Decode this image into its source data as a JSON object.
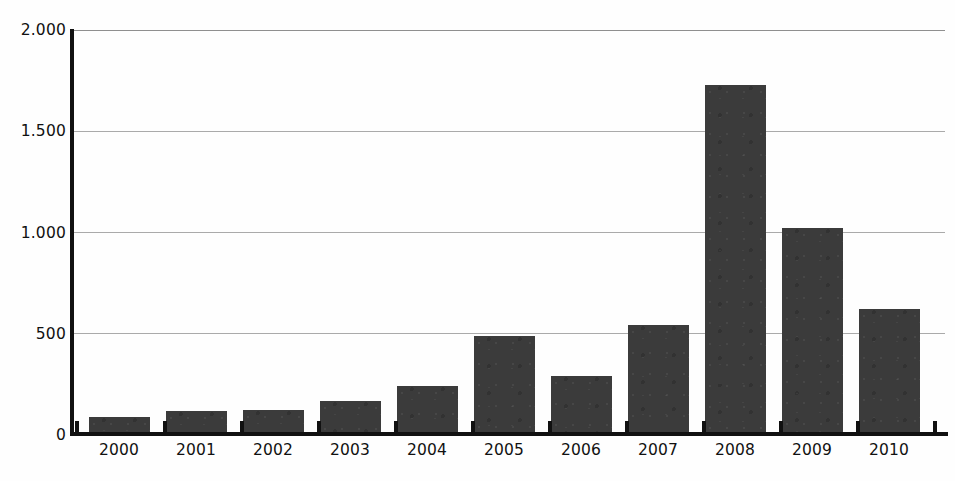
{
  "chart_data": {
    "type": "bar",
    "title": "",
    "subtitle": "",
    "xlabel": "",
    "ylabel": "",
    "categories": [
      "2000",
      "2001",
      "2002",
      "2003",
      "2004",
      "2005",
      "2006",
      "2007",
      "2008",
      "2009",
      "2010"
    ],
    "values": [
      84,
      112,
      120,
      164,
      238,
      487,
      288,
      541,
      1728,
      1020,
      620
    ],
    "series": [
      {
        "name": "",
        "values": [
          84,
          112,
          120,
          164,
          238,
          487,
          288,
          541,
          1728,
          1020,
          620
        ]
      }
    ],
    "ylim": [
      0,
      2000
    ],
    "ytick_values": [
      0,
      500,
      1000,
      1500,
      2000
    ],
    "ytick_labels": [
      "0",
      "500",
      "1.000",
      "1.500",
      "2.000"
    ],
    "grid": true,
    "legend": false,
    "legend_position": "none",
    "bar_color": "#3b3b3b",
    "grid_color": "#aaaaaa",
    "axis_color": "#111111",
    "background_color": "#ffffff"
  }
}
